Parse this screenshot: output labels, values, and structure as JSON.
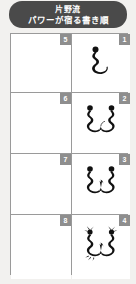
{
  "banner": {
    "line1": "片野流",
    "line2": "パワーが宿る書き順",
    "bg_color": "#4a4a4a",
    "text_color": "#ffffff"
  },
  "grid": {
    "columns": 2,
    "rows": 4,
    "border_color": "#9a9a9a",
    "cell_bg": "#ffffff",
    "badge_bg": "#8e8e8e",
    "badge_text_color": "#ffffff",
    "ink_color": "#111111",
    "cells": [
      {
        "number": "5",
        "column": "left",
        "row": 1,
        "has_glyph": false,
        "glyph_name": ""
      },
      {
        "number": "1",
        "column": "right",
        "row": 1,
        "has_glyph": true,
        "glyph_name": "stroke-order-step-1"
      },
      {
        "number": "6",
        "column": "left",
        "row": 2,
        "has_glyph": false,
        "glyph_name": ""
      },
      {
        "number": "2",
        "column": "right",
        "row": 2,
        "has_glyph": true,
        "glyph_name": "stroke-order-step-2"
      },
      {
        "number": "7",
        "column": "left",
        "row": 3,
        "has_glyph": false,
        "glyph_name": ""
      },
      {
        "number": "3",
        "column": "right",
        "row": 3,
        "has_glyph": true,
        "glyph_name": "stroke-order-step-3"
      },
      {
        "number": "8",
        "column": "left",
        "row": 4,
        "has_glyph": false,
        "glyph_name": ""
      },
      {
        "number": "4",
        "column": "right",
        "row": 4,
        "has_glyph": true,
        "glyph_name": "stroke-order-step-4"
      }
    ]
  },
  "page": {
    "background": "#f2f1ef"
  }
}
